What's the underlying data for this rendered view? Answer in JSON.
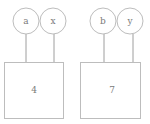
{
  "diagram": {
    "groups": [
      {
        "inputs": [
          {
            "label": "a"
          },
          {
            "label": "x"
          }
        ],
        "output": {
          "label": "4"
        }
      },
      {
        "inputs": [
          {
            "label": "b"
          },
          {
            "label": "y"
          }
        ],
        "output": {
          "label": "7"
        }
      }
    ]
  },
  "colors": {
    "stroke": "#bdbdbd",
    "text": "#7a7a7a",
    "background": "#ffffff"
  }
}
